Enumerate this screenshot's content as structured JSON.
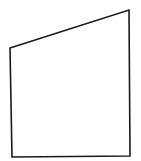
{
  "diagram": {
    "type": "quadrilateral",
    "background": "#ffffff",
    "stroke": "#1a1a1a",
    "stroke_width": 1.6,
    "fill": "none",
    "vertices": [
      {
        "label": "top-left",
        "x": 10,
        "y": 48
      },
      {
        "label": "top-right",
        "x": 129,
        "y": 10
      },
      {
        "label": "bottom-right",
        "x": 130,
        "y": 156
      },
      {
        "label": "bottom-left",
        "x": 12,
        "y": 157
      }
    ]
  }
}
